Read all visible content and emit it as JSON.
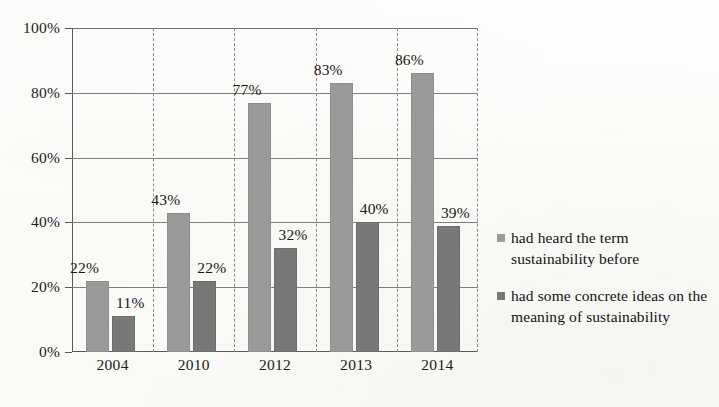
{
  "chart_data": {
    "type": "bar",
    "title": "",
    "subtitle": "",
    "xlabel": "",
    "ylabel": "",
    "categories": [
      "2004",
      "2010",
      "2012",
      "2013",
      "2014"
    ],
    "ylim": [
      0,
      100
    ],
    "yticks": [
      "0%",
      "20%",
      "40%",
      "60%",
      "80%",
      "100%"
    ],
    "ytick_values": [
      0,
      20,
      40,
      60,
      80,
      100
    ],
    "grid": "horizontal-solid-gridlines-and-dashed-vertical-category-separators",
    "legend_position": "right",
    "value_suffix": "%",
    "series": [
      {
        "name": "had heard the term sustainability before",
        "color": "#9a9a9a",
        "values": [
          22,
          43,
          77,
          83,
          86
        ],
        "labels": [
          "22%",
          "43%",
          "77%",
          "83%",
          "86%"
        ]
      },
      {
        "name": "had some concrete ideas on the meaning of sustainability",
        "color": "#787878",
        "values": [
          11,
          22,
          32,
          40,
          39
        ],
        "labels": [
          "11%",
          "22%",
          "32%",
          "40%",
          "39%"
        ]
      }
    ]
  },
  "legend": {
    "items": [
      {
        "label": "had heard the term sustainability before",
        "color": "#9a9a9a"
      },
      {
        "label": "had some concrete ideas on the meaning of sustainability",
        "color": "#787878"
      }
    ]
  },
  "colors": {
    "series1": "#9a9a9a",
    "series2": "#787878",
    "gridline": "#7d7d7d",
    "axis": "#5a5a5a",
    "separator": "#8a8a8a",
    "background": "#fdfdfb",
    "text": "#1a1a1a"
  }
}
